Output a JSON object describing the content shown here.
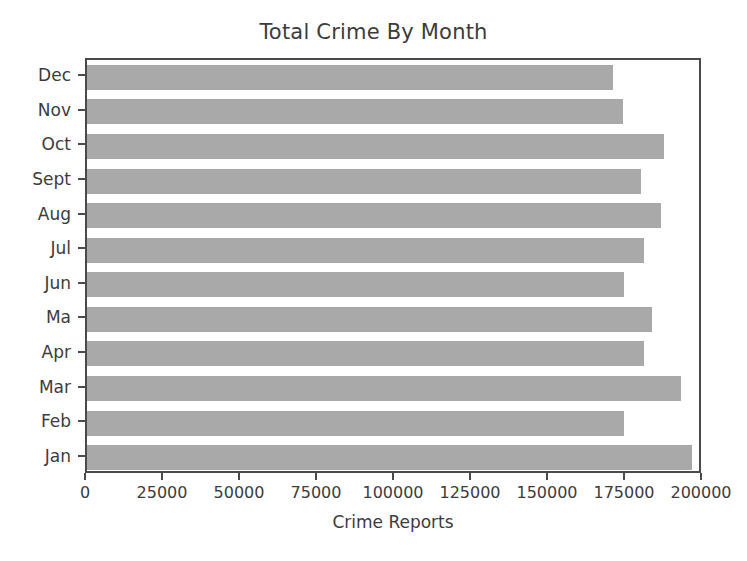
{
  "chart_data": {
    "type": "bar",
    "orientation": "horizontal",
    "title": "Total Crime By Month",
    "xlabel": "Crime Reports",
    "ylabel": "",
    "grid": false,
    "legend": null,
    "xlim": [
      0,
      200000
    ],
    "xticks": [
      0,
      25000,
      50000,
      75000,
      100000,
      125000,
      150000,
      175000,
      200000
    ],
    "xtick_labels": [
      "0",
      "25000",
      "50000",
      "75000",
      "100000",
      "125000",
      "150000",
      "175000",
      "200000"
    ],
    "categories": [
      "Dec",
      "Nov",
      "Oct",
      "Sept",
      "Aug",
      "Jul",
      "Jun",
      "Ma",
      "Apr",
      "Mar",
      "Feb",
      "Jan"
    ],
    "values": [
      170700,
      174000,
      187300,
      180000,
      186300,
      181000,
      174300,
      183300,
      180700,
      192700,
      174300,
      196300
    ],
    "bar_color": "#a9a9a9",
    "axis_color": "#4a4a4a",
    "text_color": "#3c3c3c",
    "background_color": "#ffffff"
  }
}
